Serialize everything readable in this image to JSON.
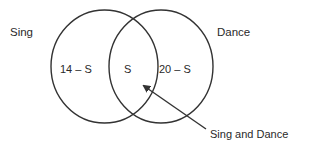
{
  "diagram": {
    "type": "venn",
    "sets": [
      {
        "id": "sing",
        "label": "Sing",
        "region_label": "14 – S"
      },
      {
        "id": "dance",
        "label": "Dance",
        "region_label": "20 – S"
      }
    ],
    "intersection": {
      "region_label": "S",
      "callout_label": "Sing and Dance"
    },
    "colors": {
      "stroke": "#333333",
      "text": "#2a2a2a",
      "background": "#ffffff"
    }
  }
}
